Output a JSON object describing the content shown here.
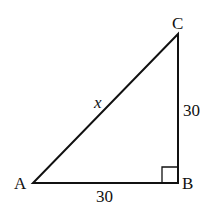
{
  "diagram": {
    "type": "right-triangle",
    "vertices": {
      "A": "A",
      "B": "B",
      "C": "C"
    },
    "right_angle_at": "B",
    "sides": {
      "AC": "x",
      "BC": "30",
      "AB": "30"
    }
  }
}
